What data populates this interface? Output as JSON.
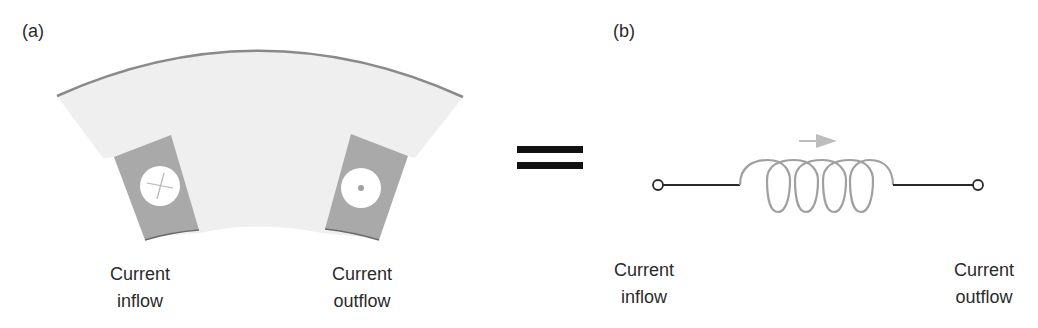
{
  "panel_a": {
    "label": "(a)",
    "captions": {
      "left": {
        "line1": "Current",
        "line2": "inflow"
      },
      "right": {
        "line1": "Current",
        "line2": "outflow"
      }
    },
    "left_conductor_symbol": "cross (current into page)",
    "right_conductor_symbol": "dot (current out of page)"
  },
  "equals_symbol": "=",
  "panel_b": {
    "label": "(b)",
    "captions": {
      "left": {
        "line1": "Current",
        "line2": "inflow"
      },
      "right": {
        "line1": "Current",
        "line2": "outflow"
      }
    },
    "coil_turns": 5,
    "arrow_direction": "right"
  },
  "colors": {
    "stator_fill": "#efefef",
    "stator_edge": "#8a8a8a",
    "slot_fill": "#a9a9a9",
    "conductor_fill": "#ffffff",
    "coil_stroke": "#a0a0a0",
    "arrow_fill": "#bdbdbd",
    "wire_stroke": "#2a2a2a",
    "equals_fill": "#111111"
  }
}
